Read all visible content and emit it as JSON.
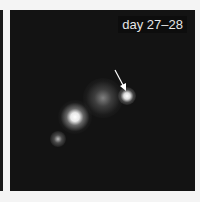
{
  "panel": {
    "label": "day 27–28",
    "colors": {
      "background": "#131313",
      "label": "#e6e6e6",
      "arrow": "#ffffff"
    },
    "annotations": [
      {
        "type": "arrow",
        "target": "bright point source upper right"
      }
    ]
  }
}
